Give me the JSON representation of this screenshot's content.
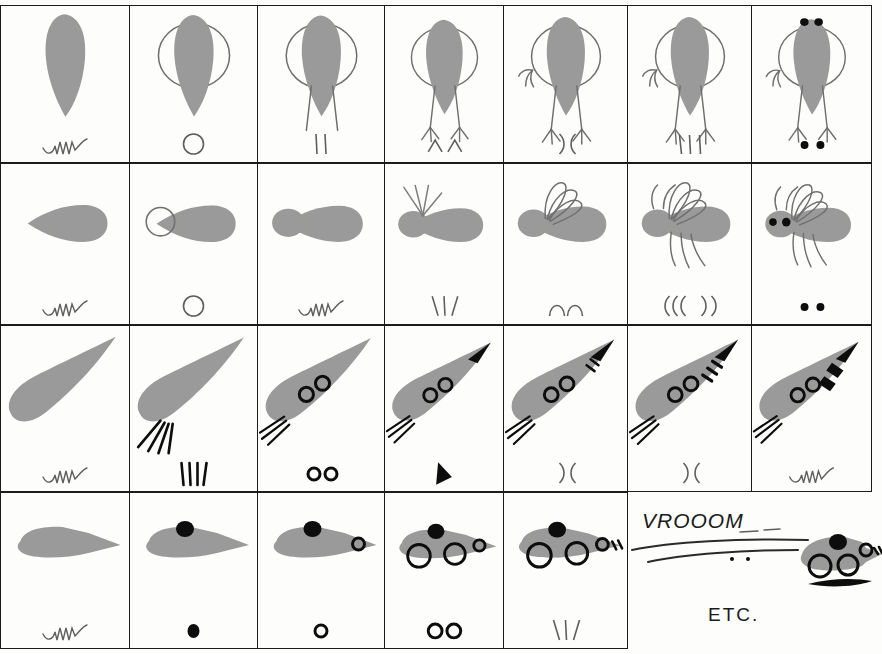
{
  "sheet": {
    "title": "Progressive drawing instruction grid",
    "background_color": "#fdfdfc",
    "ink_color": "#1c1c1c",
    "fill_gray": "#9a9a9a",
    "rows": 4,
    "columns": 7
  },
  "rows": [
    {
      "name": "bird",
      "cells": [
        {
          "label": "bird-step-1",
          "glyph": "squiggle"
        },
        {
          "label": "bird-step-2",
          "glyph": "circle-outline"
        },
        {
          "label": "bird-step-3",
          "glyph": "two-strokes"
        },
        {
          "label": "bird-step-4",
          "glyph": "two-carets"
        },
        {
          "label": "bird-step-5",
          "glyph": "two-parens"
        },
        {
          "label": "bird-step-6",
          "glyph": "three-strokes"
        },
        {
          "label": "bird-step-7",
          "glyph": "two-dots"
        }
      ]
    },
    {
      "name": "insect",
      "cells": [
        {
          "label": "insect-step-1",
          "glyph": "squiggle"
        },
        {
          "label": "insect-step-2",
          "glyph": "circle-outline"
        },
        {
          "label": "insect-step-3",
          "glyph": "squiggle"
        },
        {
          "label": "insect-step-4",
          "glyph": "three-slashes"
        },
        {
          "label": "insect-step-5",
          "glyph": "two-arcs"
        },
        {
          "label": "insect-step-6",
          "glyph": "four-parens"
        },
        {
          "label": "insect-step-7",
          "glyph": "two-dots"
        }
      ]
    },
    {
      "name": "fish-rocket",
      "cells": [
        {
          "label": "fish-step-1",
          "glyph": "squiggle"
        },
        {
          "label": "fish-step-2",
          "glyph": "four-slashes"
        },
        {
          "label": "fish-step-3",
          "glyph": "two-small-rings"
        },
        {
          "label": "fish-step-4",
          "glyph": "solid-triangle"
        },
        {
          "label": "fish-step-5",
          "glyph": "two-parens"
        },
        {
          "label": "fish-step-6",
          "glyph": "two-parens"
        },
        {
          "label": "fish-step-7",
          "glyph": "squiggle"
        }
      ]
    },
    {
      "name": "mouse-car",
      "cells": [
        {
          "label": "car-step-1",
          "glyph": "squiggle"
        },
        {
          "label": "car-step-2",
          "glyph": "solid-dot"
        },
        {
          "label": "car-step-3",
          "glyph": "small-ring"
        },
        {
          "label": "car-step-4",
          "glyph": "two-rings"
        },
        {
          "label": "car-step-5",
          "glyph": "three-slashes"
        }
      ]
    }
  ],
  "annotations": {
    "vroom_text": "VROOOM",
    "etc_text": "ETC."
  }
}
